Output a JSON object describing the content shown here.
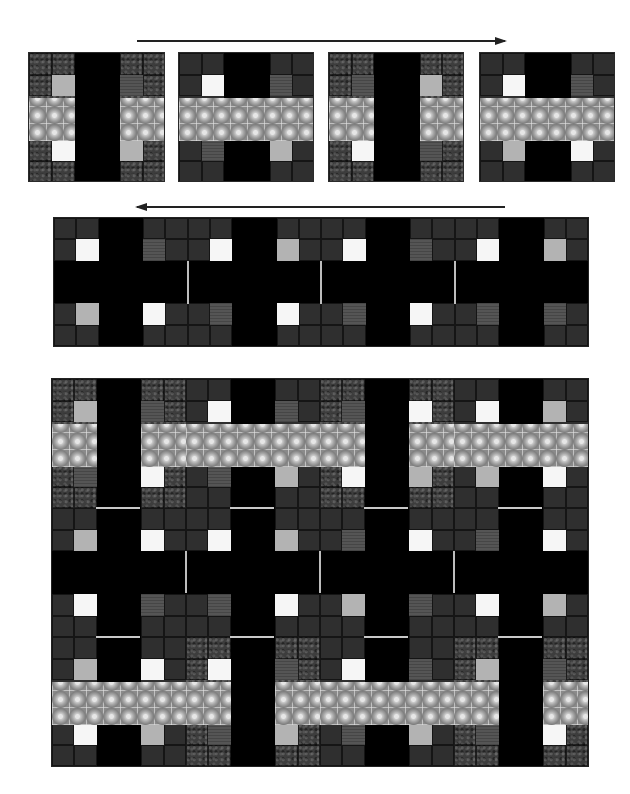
{
  "colors": {
    "background": "#ffffff",
    "black": "#000000",
    "dark_bg": "#2f2f2f",
    "textured_bg": "#3d3d3d",
    "accent_white": "#f6f6f6",
    "accent_light": "#b3b3b3",
    "accent_mid": "#555555",
    "band": "#8a8a8a"
  },
  "arrows": [
    {
      "direction": "right",
      "x1": 137,
      "x2": 505,
      "y": 40
    },
    {
      "direction": "left",
      "x1": 137,
      "x2": 505,
      "y": 206
    }
  ],
  "block_types": {
    "A": "vertical black bar on textured background, side band segments",
    "B": "full-width horizontal band on dark background, black bar top and bottom",
    "C": "black plus/cross on dark background, no band"
  },
  "top_row": {
    "label": "Row sequence (left to right)",
    "blocks": [
      {
        "type": "A",
        "x": 28,
        "y": 52,
        "w": 137,
        "h": 130,
        "accents": [
          "light",
          "mid",
          "white",
          "light"
        ]
      },
      {
        "type": "B",
        "x": 178,
        "y": 52,
        "w": 136,
        "h": 130,
        "accents": [
          "white",
          "mid",
          "mid",
          "light"
        ]
      },
      {
        "type": "A",
        "x": 328,
        "y": 52,
        "w": 136,
        "h": 130,
        "accents": [
          "mid",
          "light",
          "white",
          "mid"
        ]
      },
      {
        "type": "B",
        "x": 479,
        "y": 52,
        "w": 136,
        "h": 130,
        "accents": [
          "white",
          "mid",
          "light",
          "white"
        ]
      }
    ]
  },
  "strip": {
    "label": "Sashing strip (right to left)",
    "x": 53,
    "y": 217,
    "w": 536,
    "h": 130,
    "blocks": [
      {
        "type": "C",
        "accents": [
          "white",
          "mid",
          "light",
          "white"
        ]
      },
      {
        "type": "C",
        "accents": [
          "white",
          "light",
          "mid",
          "white"
        ]
      },
      {
        "type": "C",
        "accents": [
          "white",
          "mid",
          "mid",
          "white"
        ]
      },
      {
        "type": "C",
        "accents": [
          "white",
          "light",
          "mid",
          "mid"
        ]
      }
    ]
  },
  "assembled": {
    "label": "Assembled quilt top",
    "x": 51,
    "y": 378,
    "w": 538,
    "h": 389,
    "rows": [
      {
        "blocks": [
          {
            "type": "A",
            "accents": [
              "light",
              "mid",
              "mid",
              "white"
            ]
          },
          {
            "type": "B",
            "accents": [
              "white",
              "mid",
              "mid",
              "light"
            ]
          },
          {
            "type": "A",
            "accents": [
              "mid",
              "white",
              "white",
              "light"
            ]
          },
          {
            "type": "B",
            "accents": [
              "white",
              "light",
              "light",
              "white"
            ]
          }
        ]
      },
      {
        "blocks": [
          {
            "type": "C",
            "accents": [
              "light",
              "white",
              "white",
              "mid"
            ]
          },
          {
            "type": "C",
            "accents": [
              "white",
              "light",
              "mid",
              "white"
            ]
          },
          {
            "type": "C",
            "accents": [
              "mid",
              "white",
              "light",
              "mid"
            ]
          },
          {
            "type": "C",
            "accents": [
              "mid",
              "white",
              "white",
              "light"
            ]
          }
        ]
      },
      {
        "blocks": [
          {
            "type": "B",
            "accents": [
              "light",
              "white",
              "white",
              "light"
            ]
          },
          {
            "type": "A",
            "accents": [
              "white",
              "mid",
              "mid",
              "light"
            ]
          },
          {
            "type": "B",
            "accents": [
              "white",
              "mid",
              "mid",
              "light"
            ]
          },
          {
            "type": "A",
            "accents": [
              "light",
              "mid",
              "mid",
              "white"
            ]
          }
        ]
      }
    ]
  }
}
